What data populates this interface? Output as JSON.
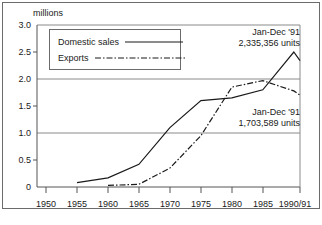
{
  "chart_data": {
    "type": "line",
    "title": "",
    "subtitle": "",
    "xlabel": "",
    "ylabel": "millions",
    "units_label": "millions",
    "xlim": [
      1950,
      1991
    ],
    "ylim": [
      0,
      3.0
    ],
    "grid": "horizontal gridlines at 1.0, 2.0, 3.0",
    "legend_position": "upper-left inside plot",
    "x_tick_labels": [
      "1950",
      "1955",
      "1960",
      "1965",
      "1970",
      "1975",
      "1980",
      "1985",
      "1990/91"
    ],
    "x_tick_values": [
      1950,
      1955,
      1960,
      1965,
      1970,
      1975,
      1980,
      1985,
      1991
    ],
    "y_tick_labels": [
      "0",
      "0.5",
      "1.0",
      "1.5",
      "2.0",
      "2.5",
      "3.0"
    ],
    "y_tick_values": [
      0,
      0.5,
      1.0,
      1.5,
      2.0,
      2.5,
      3.0
    ],
    "series": [
      {
        "name": "Domestic sales",
        "style": "solid",
        "color": "#1a1a1a",
        "x": [
          1955,
          1960,
          1965,
          1970,
          1975,
          1980,
          1985,
          1990,
          1991
        ],
        "values": [
          0.08,
          0.17,
          0.42,
          1.1,
          1.6,
          1.65,
          1.8,
          2.5,
          2.34
        ]
      },
      {
        "name": "Exports",
        "style": "dash-dot",
        "color": "#1a1a1a",
        "x": [
          1960,
          1965,
          1970,
          1975,
          1980,
          1985,
          1990,
          1991
        ],
        "values": [
          0.03,
          0.05,
          0.35,
          0.95,
          1.85,
          1.97,
          1.78,
          1.7
        ]
      }
    ],
    "annotations": [
      {
        "name": "domestic-sales-callout",
        "line1": "Jan-Dec '91",
        "line2": "2,335,356 units"
      },
      {
        "name": "exports-callout",
        "line1": "Jan-Dec '91",
        "line2": "1,703,589 units"
      }
    ]
  },
  "legend": {
    "items": [
      {
        "label": "Domestic sales",
        "style": "solid"
      },
      {
        "label": "Exports",
        "style": "dash-dot"
      }
    ]
  }
}
